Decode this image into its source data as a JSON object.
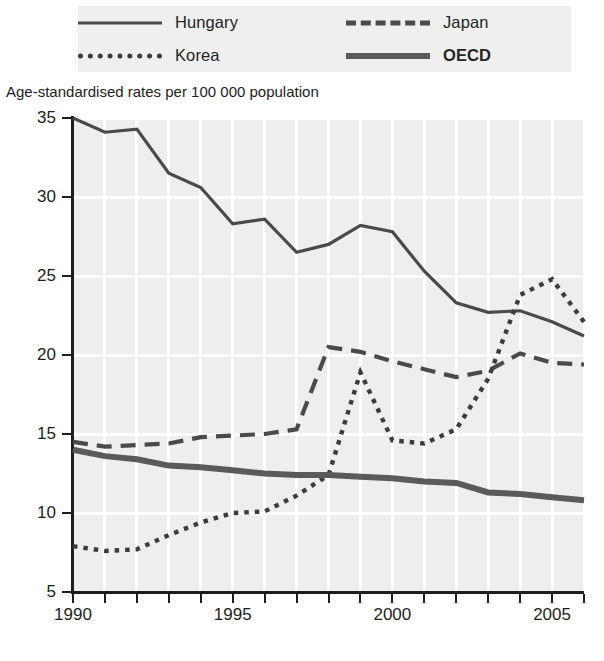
{
  "legend": {
    "entries": [
      {
        "label": "Hungary",
        "style": "solid-thin",
        "bold": false,
        "color": "#4a4a4a"
      },
      {
        "label": "Japan",
        "style": "dashed",
        "bold": false,
        "color": "#4a4a4a"
      },
      {
        "label": "Korea",
        "style": "dotted",
        "bold": false,
        "color": "#3c3c3c"
      },
      {
        "label": "OECD",
        "style": "solid-thick",
        "bold": true,
        "color": "#5a5a5a"
      }
    ],
    "background": "#efeff0"
  },
  "axis_caption": "Age-standardised rates per 100 000 population",
  "chart_data": {
    "type": "line",
    "title": "",
    "subtitle": "",
    "xlabel": "",
    "ylabel": "Age-standardised rates per 100 000 population",
    "xlim": [
      1990,
      2006
    ],
    "ylim": [
      5,
      35
    ],
    "ytick_labels": [
      "35",
      "30",
      "25",
      "20",
      "15",
      "10",
      "5"
    ],
    "yticks": [
      35,
      30,
      25,
      20,
      15,
      10,
      5
    ],
    "xtick_labels": [
      "1990",
      "1995",
      "2000",
      "2005"
    ],
    "xticks": [
      1990,
      1995,
      2000,
      2005
    ],
    "xticks_minor": [
      1991,
      1992,
      1993,
      1994,
      1996,
      1997,
      1998,
      1999,
      2001,
      2002,
      2003,
      2004,
      2006
    ],
    "grid": true,
    "grid_color": "#ffffff",
    "plot_background": "#eeeeef",
    "legend_position": "above-plot",
    "x": [
      1990,
      1991,
      1992,
      1993,
      1994,
      1995,
      1996,
      1997,
      1998,
      1999,
      2000,
      2001,
      2002,
      2003,
      2004,
      2005,
      2006
    ],
    "series": [
      {
        "name": "Hungary",
        "style": "solid-thin",
        "color": "#4a4a4a",
        "values": [
          35.0,
          34.1,
          34.3,
          31.5,
          30.6,
          28.3,
          28.6,
          26.5,
          27.0,
          28.2,
          27.8,
          25.3,
          23.3,
          22.7,
          22.8,
          22.1,
          21.2
        ]
      },
      {
        "name": "Japan",
        "style": "dashed",
        "color": "#4a4a4a",
        "values": [
          14.5,
          14.2,
          14.3,
          14.4,
          14.8,
          14.9,
          15.0,
          15.3,
          20.5,
          20.2,
          19.6,
          19.1,
          18.6,
          19.0,
          20.1,
          19.5,
          19.4
        ]
      },
      {
        "name": "Korea",
        "style": "dotted",
        "color": "#3c3c3c",
        "values": [
          7.9,
          7.6,
          7.7,
          8.6,
          9.4,
          10.0,
          10.1,
          11.1,
          12.4,
          18.9,
          14.6,
          14.4,
          15.3,
          18.5,
          23.8,
          24.8,
          22.1
        ]
      },
      {
        "name": "OECD",
        "style": "solid-thick",
        "color": "#5a5a5a",
        "values": [
          14.0,
          13.6,
          13.4,
          13.0,
          12.9,
          12.7,
          12.5,
          12.4,
          12.4,
          12.3,
          12.2,
          12.0,
          11.9,
          11.3,
          11.2,
          11.0,
          10.8
        ]
      }
    ]
  }
}
